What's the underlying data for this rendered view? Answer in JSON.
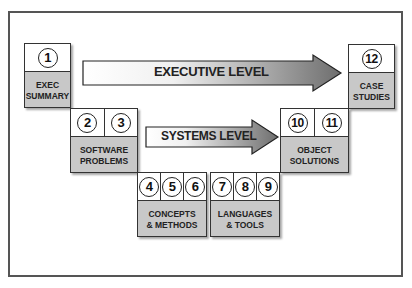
{
  "diagram": {
    "arrows": [
      {
        "label": "EXECUTIVE LEVEL"
      },
      {
        "label": "SYSTEMS LEVEL"
      }
    ],
    "boxes": [
      {
        "numbers": [
          "1"
        ],
        "label": "EXEC\nSUMMARY"
      },
      {
        "numbers": [
          "2",
          "3"
        ],
        "label": "SOFTWARE\nPROBLEMS"
      },
      {
        "numbers": [
          "4",
          "5",
          "6"
        ],
        "label": "CONCEPTS\n& METHODS"
      },
      {
        "numbers": [
          "7",
          "8",
          "9"
        ],
        "label": "LANGUAGES\n& TOOLS"
      },
      {
        "numbers": [
          "10",
          "11"
        ],
        "label": "OBJECT\nSOLUTIONS"
      },
      {
        "numbers": [
          "12"
        ],
        "label": "CASE\nSTUDIES"
      }
    ],
    "colors": {
      "box_fill": "#c8c8c8",
      "arrow_dark": "#7a7a7a",
      "frame": "#555555"
    }
  }
}
